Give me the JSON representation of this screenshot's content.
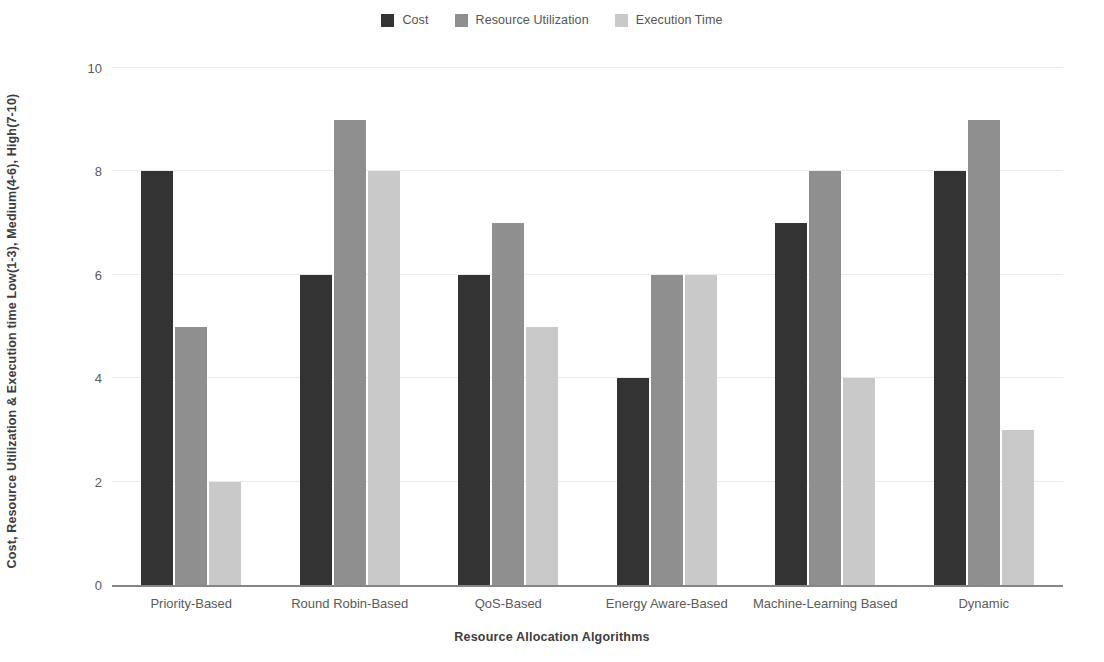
{
  "legend": {
    "position": "top-center",
    "items": [
      {
        "label": "Cost",
        "color": "#333333",
        "icon": "square-swatch-icon"
      },
      {
        "label": "Resource Utilization",
        "color": "#8f8f8f",
        "icon": "square-swatch-icon"
      },
      {
        "label": "Execution Time",
        "color": "#c9c9c9",
        "icon": "square-swatch-icon"
      }
    ]
  },
  "axes": {
    "ylabel": "Cost, Resource Utilization & Execution time   Low(1-3), Medium(4-6), High(7-10)",
    "xlabel": "Resource Allocation Algorithms",
    "yticks": [
      "0",
      "2",
      "4",
      "6",
      "8",
      "10"
    ],
    "gridline_color": "#ececed",
    "axis_color": "#868686"
  },
  "chart_data": {
    "type": "bar",
    "title": "",
    "xlabel": "Resource Allocation Algorithms",
    "ylabel": "Cost, Resource Utilization & Execution time   Low(1-3), Medium(4-6), High(7-10)",
    "ylim": [
      0,
      10
    ],
    "yticks": [
      0,
      2,
      4,
      6,
      8,
      10
    ],
    "grid": true,
    "legend_position": "top-center",
    "categories": [
      "Priority-Based",
      "Round Robin-Based",
      "QoS-Based",
      "Energy Aware-Based",
      "Machine-Learning Based",
      "Dynamic"
    ],
    "series": [
      {
        "name": "Cost",
        "color": "#333333",
        "values": [
          8,
          6,
          6,
          4,
          7,
          8
        ]
      },
      {
        "name": "Resource Utilization",
        "color": "#8f8f8f",
        "values": [
          5,
          9,
          7,
          6,
          8,
          9
        ]
      },
      {
        "name": "Execution Time",
        "color": "#c9c9c9",
        "values": [
          2,
          8,
          5,
          6,
          4,
          3
        ]
      }
    ]
  }
}
